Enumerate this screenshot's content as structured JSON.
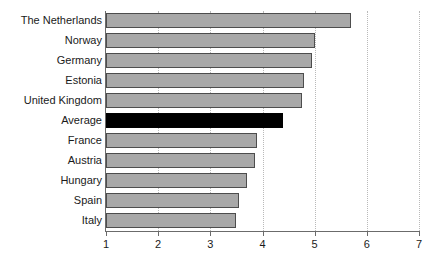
{
  "chart_data": {
    "type": "bar",
    "orientation": "horizontal",
    "title": "",
    "xlabel": "",
    "ylabel": "",
    "categories": [
      "The Netherlands",
      "Norway",
      "Germany",
      "Estonia",
      "United Kingdom",
      "Average",
      "France",
      "Austria",
      "Hungary",
      "Spain",
      "Italy"
    ],
    "values": [
      5.7,
      5.0,
      4.95,
      4.8,
      4.75,
      4.4,
      3.9,
      3.85,
      3.7,
      3.55,
      3.5
    ],
    "highlight_category": "Average",
    "highlight_color": "#000000",
    "bar_color": "#a8a8a8",
    "bar_border_color": "#4d4d4d",
    "xlim": [
      1,
      7
    ],
    "x_ticks": [
      1,
      2,
      3,
      4,
      5,
      6,
      7
    ],
    "x_tick_labels": [
      "1",
      "2",
      "3",
      "4",
      "5",
      "6",
      "7"
    ],
    "grid": "vertical-dotted",
    "grid_color": "#b9b9b9",
    "legend": null,
    "axis_color": "#6b6b6b"
  }
}
